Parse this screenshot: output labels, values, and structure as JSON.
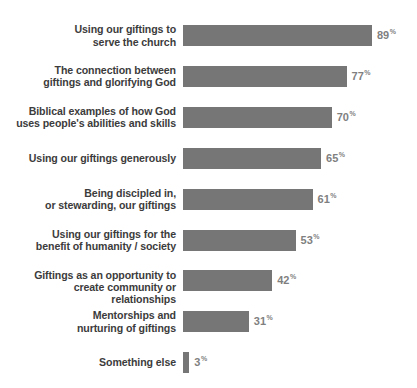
{
  "chart_data": {
    "type": "bar",
    "orientation": "horizontal",
    "title": "",
    "subtitle": "",
    "xlabel": "",
    "ylabel": "",
    "xlim": [
      0,
      100
    ],
    "grid": false,
    "legend": false,
    "value_suffix": "%",
    "categories": [
      "Using our giftings to\nserve the church",
      "The connection between\ngiftings and glorifying God",
      "Biblical examples of how God\nuses people's abilities and skills",
      "Using our giftings generously",
      "Being discipled in,\nor stewarding, our giftings",
      "Using our giftings for the\nbenefit of humanity / society",
      "Giftings as an opportunity to\ncreate community or relationships",
      "Mentorships and\nnurturing of giftings",
      "Something else"
    ],
    "values": [
      89,
      77,
      70,
      65,
      61,
      53,
      42,
      31,
      3
    ],
    "value_labels": [
      "89",
      "77",
      "70",
      "65",
      "61",
      "53",
      "42",
      "31",
      "3"
    ],
    "colors": {
      "bar": "#767676",
      "background": "#ffffff",
      "label_text": "#3c3c3c",
      "value_text": "#7f7f7f"
    }
  }
}
